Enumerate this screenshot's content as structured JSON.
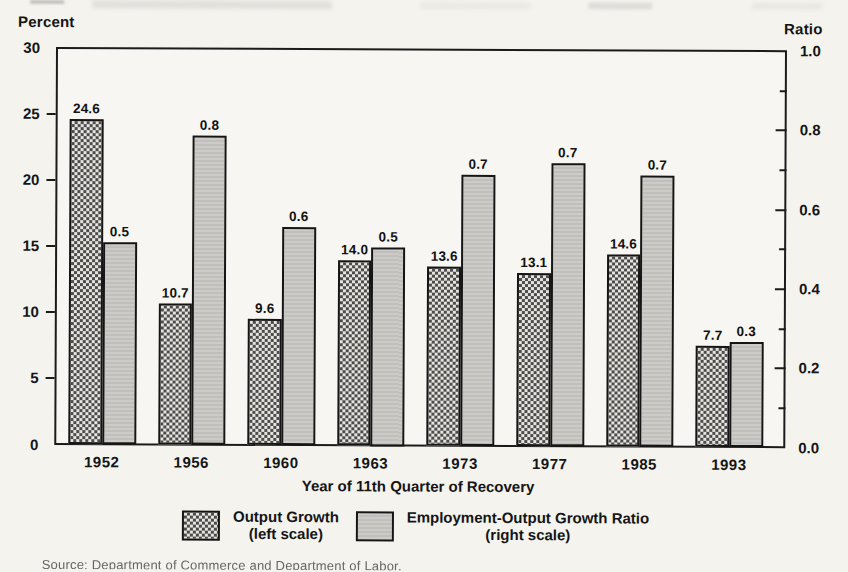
{
  "chart_data": {
    "type": "bar",
    "categories": [
      "1952",
      "1956",
      "1960",
      "1963",
      "1973",
      "1977",
      "1985",
      "1993"
    ],
    "series": [
      {
        "name": "Output Growth",
        "scale_note": "(left scale)",
        "axis": "left",
        "pattern": "crosshatch",
        "values": [
          24.6,
          10.7,
          9.6,
          14.0,
          13.6,
          13.1,
          14.6,
          7.7
        ],
        "value_labels": [
          "24.6",
          "10.7",
          "9.6",
          "14.0",
          "13.6",
          "13.1",
          "14.6",
          "7.7"
        ]
      },
      {
        "name": "Employment-Output Growth Ratio",
        "scale_note": "(right scale)",
        "axis": "right",
        "pattern": "solid-gray",
        "values": [
          0.51,
          0.78,
          0.55,
          0.5,
          0.685,
          0.715,
          0.685,
          0.265
        ],
        "value_labels": [
          "0.5",
          "0.8",
          "0.6",
          "0.5",
          "0.7",
          "0.7",
          "0.7",
          "0.3"
        ]
      }
    ],
    "left_axis": {
      "label": "Percent",
      "range": [
        0,
        30
      ],
      "tick_labels": [
        "30",
        "25",
        "20",
        "15",
        "10",
        "5",
        "0"
      ]
    },
    "right_axis": {
      "label": "Ratio",
      "range": [
        0.0,
        1.0
      ],
      "tick_labels": [
        "1.0",
        "0.8",
        "0.6",
        "0.4",
        "0.2",
        "0.0"
      ],
      "minor_tick_step": 0.1
    },
    "xlabel": "Year of 11th Quarter of Recovery",
    "grid": false,
    "legend_position": "bottom",
    "legend": {
      "items": [
        {
          "line1": "Output Growth",
          "line2": "(left scale)"
        },
        {
          "line1": "Employment-Output Growth Ratio",
          "line2": "(right scale)"
        }
      ]
    }
  },
  "source_line": "Source: Department of Commerce and Department of Labor.",
  "colors": {
    "paper": "#f4f3ee",
    "bar_outline": "#151515",
    "ratio_bar_fill": "#c6c5c1",
    "output_bar_pattern_dark": "#4c4c4c",
    "output_bar_pattern_light": "#e6e4df",
    "axis_line": "#1b1b1b"
  }
}
